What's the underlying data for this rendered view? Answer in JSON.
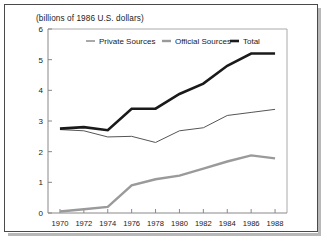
{
  "chart_data": {
    "type": "line",
    "title": "",
    "subtitle": "(billions of 1986 U.S. dollars)",
    "xlabel": "",
    "ylabel": "",
    "x": [
      1970,
      1972,
      1974,
      1976,
      1978,
      1980,
      1982,
      1984,
      1986,
      1988
    ],
    "xlim": [
      1969,
      1989
    ],
    "ylim": [
      0,
      6
    ],
    "yticks": [
      0,
      1,
      2,
      3,
      4,
      5,
      6
    ],
    "xticks": [
      1970,
      1972,
      1974,
      1976,
      1978,
      1980,
      1982,
      1984,
      1986,
      1988
    ],
    "ytick_labels": [
      "0",
      "1",
      "2",
      "3",
      "4",
      "5",
      "6"
    ],
    "xtick_labels": [
      "1970",
      "1972",
      "1974",
      "1976",
      "1978",
      "1980",
      "1982",
      "1984",
      "1986",
      "1988"
    ],
    "grid": false,
    "legend_position": "top-center-inside",
    "series": [
      {
        "name": "Private Sources",
        "color": "#555555",
        "line_width": 1,
        "values": [
          2.72,
          2.68,
          2.48,
          2.5,
          2.3,
          2.68,
          2.78,
          3.18,
          3.28,
          3.38
        ]
      },
      {
        "name": "Official Sources",
        "color": "#9a9a9a",
        "line_width": 2.4,
        "values": [
          0.05,
          0.12,
          0.2,
          0.9,
          1.1,
          1.22,
          1.45,
          1.68,
          1.88,
          1.78
        ]
      },
      {
        "name": "Total",
        "color": "#1a1a1a",
        "line_width": 2.6,
        "values": [
          2.75,
          2.8,
          2.7,
          3.4,
          3.4,
          3.88,
          4.22,
          4.8,
          5.2,
          5.2
        ]
      }
    ]
  },
  "legend": {
    "items": [
      {
        "label": "Private Sources"
      },
      {
        "label": "Official Sources"
      },
      {
        "label": "Total"
      }
    ]
  },
  "axes": {
    "y_axis_name": "y-axis",
    "x_axis_name": "x-axis"
  }
}
